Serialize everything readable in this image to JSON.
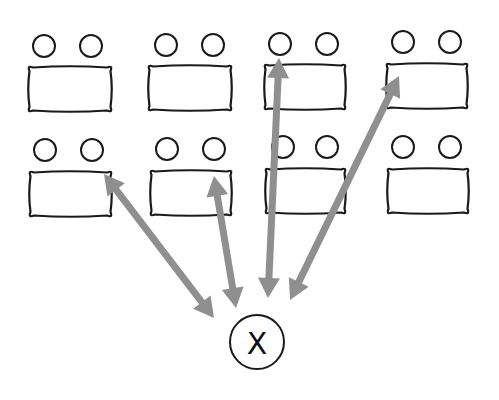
{
  "diagram": {
    "type": "classroom-seating-interaction",
    "colors": {
      "background": "#ffffff",
      "outline": "#1a1a1a",
      "arrow": "#8f8f8f"
    },
    "teacher": {
      "label": "X",
      "cx": 257,
      "cy": 342,
      "r": 27
    },
    "tables": [
      {
        "id": 1,
        "row": 1,
        "col": 1,
        "x": 28,
        "y": 66,
        "w": 84,
        "h": 46,
        "seats": [
          [
            44,
            46
          ],
          [
            91,
            46
          ]
        ]
      },
      {
        "id": 2,
        "row": 1,
        "col": 2,
        "x": 148,
        "y": 65,
        "w": 84,
        "h": 46,
        "seats": [
          [
            166,
            45
          ],
          [
            213,
            45
          ]
        ]
      },
      {
        "id": 3,
        "row": 1,
        "col": 3,
        "x": 264,
        "y": 64,
        "w": 82,
        "h": 46,
        "seats": [
          [
            280,
            44
          ],
          [
            327,
            44
          ]
        ]
      },
      {
        "id": 4,
        "row": 1,
        "col": 4,
        "x": 386,
        "y": 63,
        "w": 82,
        "h": 46,
        "seats": [
          [
            403,
            42
          ],
          [
            450,
            42
          ]
        ]
      },
      {
        "id": 5,
        "row": 2,
        "col": 1,
        "x": 29,
        "y": 171,
        "w": 83,
        "h": 46,
        "seats": [
          [
            45,
            150
          ],
          [
            92,
            150
          ]
        ]
      },
      {
        "id": 6,
        "row": 2,
        "col": 2,
        "x": 150,
        "y": 170,
        "w": 82,
        "h": 46,
        "seats": [
          [
            167,
            149
          ],
          [
            214,
            149
          ]
        ]
      },
      {
        "id": 7,
        "row": 2,
        "col": 3,
        "x": 265,
        "y": 168,
        "w": 81,
        "h": 46,
        "seats": [
          [
            283,
            147
          ],
          [
            327,
            147
          ]
        ]
      },
      {
        "id": 8,
        "row": 2,
        "col": 4,
        "x": 387,
        "y": 168,
        "w": 82,
        "h": 46,
        "seats": [
          [
            403,
            147
          ],
          [
            450,
            147
          ]
        ]
      }
    ],
    "arrows": [
      {
        "from": [
          104,
          174
        ],
        "to": [
          214,
          318
        ],
        "bidirectional": true,
        "target_table": 5
      },
      {
        "from": [
          214,
          176
        ],
        "to": [
          236,
          308
        ],
        "bidirectional": true,
        "target_table": 6
      },
      {
        "from": [
          279,
          58
        ],
        "to": [
          268,
          298
        ],
        "bidirectional": true,
        "target_table": 3
      },
      {
        "from": [
          399,
          76
        ],
        "to": [
          290,
          300
        ],
        "bidirectional": true,
        "target_table": 4
      }
    ]
  }
}
